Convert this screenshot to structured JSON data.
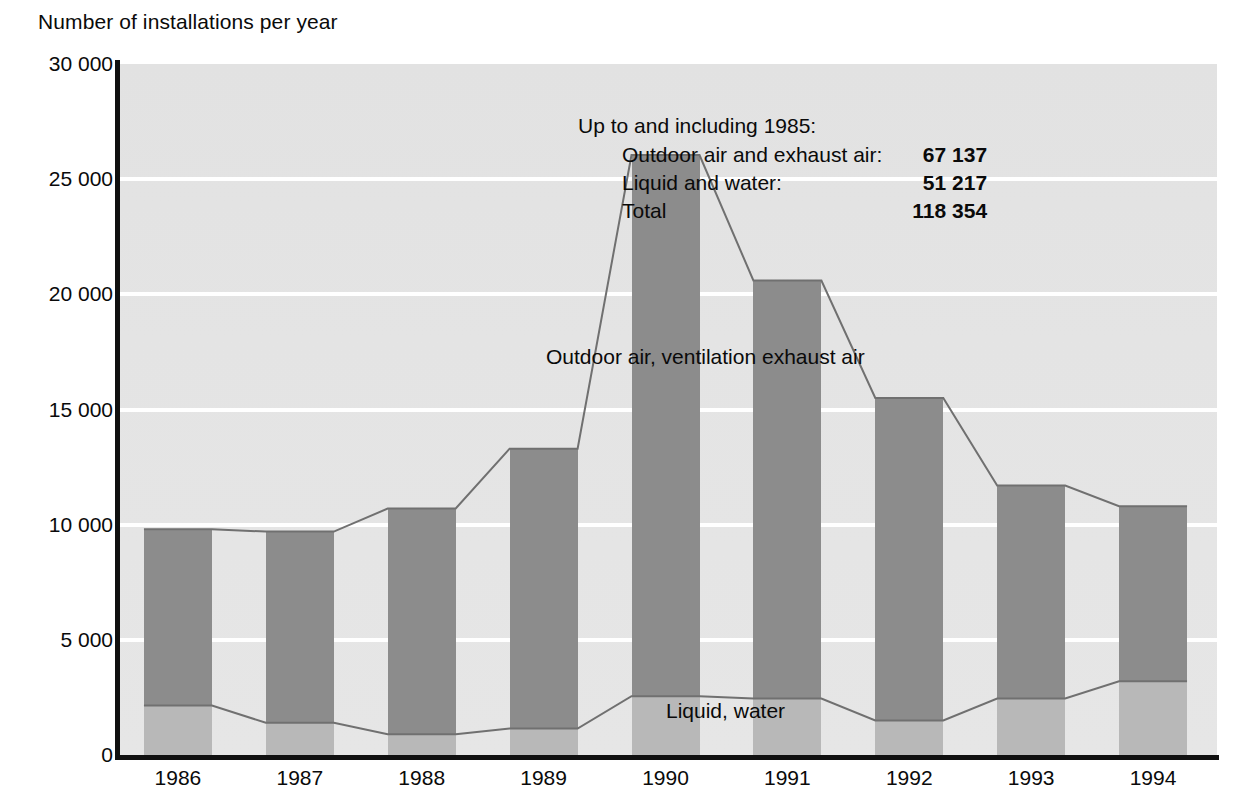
{
  "axis_title": "Number of installations per year",
  "annotation": {
    "heading": "Up to and including 1985:",
    "rows": [
      {
        "label": "Outdoor air and exhaust air:",
        "value": "67 137"
      },
      {
        "label": "Liquid and water:",
        "value": "51 217"
      },
      {
        "label": "Total",
        "value": "118 354"
      }
    ]
  },
  "series_labels": {
    "outdoor": "Outdoor air, ventilation exhaust air",
    "liquid": "Liquid, water"
  },
  "colors": {
    "plot_background": "#e4e4e4",
    "outdoor_bar": "#8c8c8c",
    "liquid_bar": "#b8b8b8",
    "gridline": "#ffffff",
    "axis": "#101010",
    "connector_line": "#707070",
    "text": "#0a0a0a"
  },
  "chart_data": {
    "type": "bar",
    "title": "",
    "subtitle": "",
    "xlabel": "",
    "ylabel": "Number of installations per year",
    "ylim": [
      0,
      30000
    ],
    "yticks": [
      0,
      5000,
      10000,
      15000,
      20000,
      25000,
      30000
    ],
    "ytick_labels": [
      "0",
      "5 000",
      "10 000",
      "15 000",
      "20 000",
      "25 000",
      "30 000"
    ],
    "grid": true,
    "legend": "in-plot annotations",
    "stacked": true,
    "categories": [
      "1986",
      "1987",
      "1988",
      "1989",
      "1990",
      "1991",
      "1992",
      "1993",
      "1994"
    ],
    "series": [
      {
        "name": "Liquid, water",
        "values": [
          2150,
          1400,
          900,
          1150,
          2550,
          2450,
          1500,
          2450,
          3200
        ]
      },
      {
        "name": "Outdoor air, ventilation exhaust air",
        "values": [
          7650,
          8300,
          9800,
          12150,
          23500,
          18150,
          14000,
          9250,
          7600
        ]
      }
    ],
    "totals": [
      9800,
      9700,
      10700,
      13300,
      26050,
      20600,
      15500,
      11700,
      10800
    ],
    "notes": {
      "heading": "Up to and including 1985:",
      "outdoor_air_and_exhaust_air": 67137,
      "liquid_and_water": 51217,
      "total": 118354
    }
  }
}
